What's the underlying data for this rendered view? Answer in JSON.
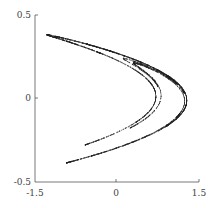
{
  "chart_data": {
    "type": "scatter",
    "title": "",
    "xlabel": "",
    "ylabel": "",
    "xlim": [
      -1.5,
      1.5
    ],
    "ylim": [
      -0.5,
      0.5
    ],
    "xticks": [
      "-1.5",
      "0",
      "1.5"
    ],
    "yticks": [
      "-0.5",
      "0",
      "0.5"
    ],
    "grid": false,
    "legend": null,
    "parameters": {
      "a": 1.4,
      "b": 0.3
    },
    "colors": {
      "points": "#222222",
      "axis": "#555555"
    }
  }
}
